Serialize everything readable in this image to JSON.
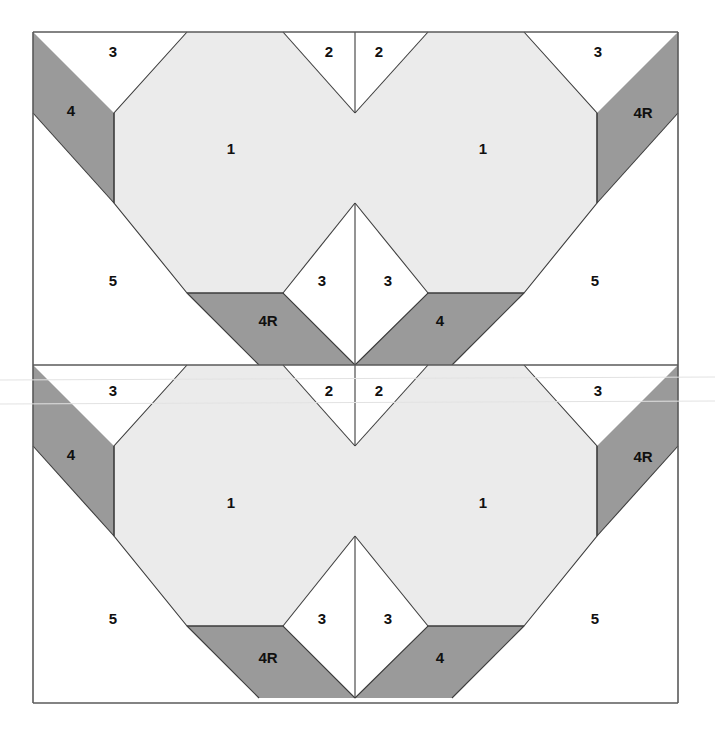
{
  "figure": {
    "kind": "quilt-block-piecing-diagram",
    "block_count": 2,
    "colors": {
      "light_shade": "#ebebeb",
      "dark_shade": "#9a9a9a",
      "background": "#ffffff",
      "line": "#3c3c3c"
    },
    "frame": {
      "left": 33,
      "top": 32,
      "right": 678,
      "bottom": 703,
      "mid_y": 365,
      "center_x": 355
    }
  },
  "blocks": [
    {
      "id": "block-top",
      "halves": [
        {
          "id": "block-top-left-half",
          "labels": [
            {
              "id": "t-l-3",
              "text": "3",
              "x": 113,
              "y": 53
            },
            {
              "id": "t-l-4",
              "text": "4",
              "x": 71,
              "y": 112
            },
            {
              "id": "t-l-1",
              "text": "1",
              "x": 231,
              "y": 150
            },
            {
              "id": "t-l-5",
              "text": "5",
              "x": 113,
              "y": 282
            },
            {
              "id": "t-l-4R",
              "text": "4R",
              "x": 268,
              "y": 322
            },
            {
              "id": "t-l-2",
              "text": "2",
              "x": 329,
              "y": 53
            },
            {
              "id": "t-l-3b",
              "text": "3",
              "x": 322,
              "y": 282
            }
          ]
        },
        {
          "id": "block-top-right-half",
          "labels": [
            {
              "id": "t-r-2",
              "text": "2",
              "x": 379,
              "y": 53
            },
            {
              "id": "t-r-3",
              "text": "3",
              "x": 598,
              "y": 53
            },
            {
              "id": "t-r-4R",
              "text": "4R",
              "x": 643,
              "y": 114
            },
            {
              "id": "t-r-1",
              "text": "1",
              "x": 483,
              "y": 150
            },
            {
              "id": "t-r-5",
              "text": "5",
              "x": 595,
              "y": 282
            },
            {
              "id": "t-r-3b",
              "text": "3",
              "x": 388,
              "y": 282
            },
            {
              "id": "t-r-4",
              "text": "4",
              "x": 440,
              "y": 322
            }
          ]
        }
      ]
    },
    {
      "id": "block-bottom",
      "halves": [
        {
          "id": "block-bottom-left-half",
          "labels": [
            {
              "id": "b-l-3",
              "text": "3",
              "x": 113,
              "y": 392
            },
            {
              "id": "b-l-4",
              "text": "4",
              "x": 71,
              "y": 456
            },
            {
              "id": "b-l-1",
              "text": "1",
              "x": 231,
              "y": 504
            },
            {
              "id": "b-l-5",
              "text": "5",
              "x": 113,
              "y": 620
            },
            {
              "id": "b-l-4R",
              "text": "4R",
              "x": 268,
              "y": 659
            },
            {
              "id": "b-l-2",
              "text": "2",
              "x": 329,
              "y": 392
            },
            {
              "id": "b-l-3b",
              "text": "3",
              "x": 322,
              "y": 620
            }
          ]
        },
        {
          "id": "block-bottom-right-half",
          "labels": [
            {
              "id": "b-r-2",
              "text": "2",
              "x": 379,
              "y": 392
            },
            {
              "id": "b-r-3",
              "text": "3",
              "x": 598,
              "y": 392
            },
            {
              "id": "b-r-4R",
              "text": "4R",
              "x": 643,
              "y": 458
            },
            {
              "id": "b-r-1",
              "text": "1",
              "x": 483,
              "y": 504
            },
            {
              "id": "b-r-5",
              "text": "5",
              "x": 595,
              "y": 620
            },
            {
              "id": "b-r-3b",
              "text": "3",
              "x": 388,
              "y": 620
            },
            {
              "id": "b-r-4",
              "text": "4",
              "x": 440,
              "y": 659
            }
          ]
        }
      ]
    }
  ],
  "piece_legend": [
    {
      "number": "1",
      "role": "center-octagon",
      "shade": "light"
    },
    {
      "number": "2",
      "role": "inner-corner-triangle",
      "shade": "white"
    },
    {
      "number": "3",
      "role": "corner-triangle",
      "shade": "white"
    },
    {
      "number": "4",
      "role": "parallelogram-strip",
      "shade": "dark"
    },
    {
      "number": "4R",
      "role": "parallelogram-strip-reversed",
      "shade": "dark"
    },
    {
      "number": "5",
      "role": "large-corner-triangle",
      "shade": "white"
    }
  ]
}
